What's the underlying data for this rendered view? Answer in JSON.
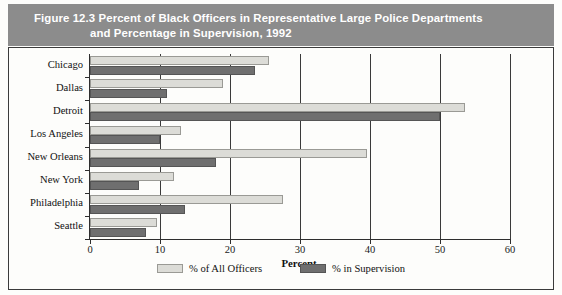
{
  "figure": {
    "title_line1": "Figure 12.3  Percent of Black Officers in Representative Large Police Departments",
    "title_line2": "and Percentage in Supervision, 1992",
    "band_color": "#8c8c8c",
    "title_color": "#ffffff"
  },
  "chart_data": {
    "type": "bar",
    "orientation": "horizontal",
    "title": "Figure 12.3  Percent of Black Officers in Representative Large Police Departments and Percentage in Supervision, 1992",
    "xlabel": "Percent",
    "ylabel": "",
    "xlim": [
      0,
      60
    ],
    "xticks": [
      0,
      10,
      20,
      30,
      40,
      50,
      60
    ],
    "grid": true,
    "legend_position": "bottom-center",
    "categories": [
      "Chicago",
      "Dallas",
      "Detroit",
      "Los Angeles",
      "New Orleans",
      "New York",
      "Philadelphia",
      "Seattle"
    ],
    "series": [
      {
        "name": "% of All Officers",
        "color": "#dcdcd7",
        "values": [
          25.5,
          19.0,
          53.5,
          13.0,
          39.5,
          12.0,
          27.5,
          9.5
        ]
      },
      {
        "name": "% in Supervision",
        "color": "#6f6f6f",
        "values": [
          23.5,
          11.0,
          50.0,
          10.0,
          18.0,
          7.0,
          13.5,
          8.0
        ]
      }
    ]
  },
  "axis": {
    "x_title": "Percent"
  },
  "legend": {
    "items": [
      {
        "label": "% of All Officers",
        "swatch": "all"
      },
      {
        "label": "% in Supervision",
        "swatch": "sup"
      }
    ]
  }
}
